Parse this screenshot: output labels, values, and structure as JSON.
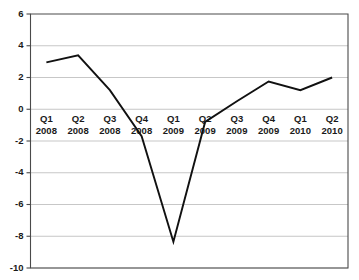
{
  "chart_data": {
    "type": "line",
    "title": "",
    "subtitle": "",
    "xlabel": "",
    "ylabel": "",
    "categories": [
      "Q1 2008",
      "Q2 2008",
      "Q3 2008",
      "Q4 2008",
      "Q1 2009",
      "Q2 2009",
      "Q3 2009",
      "Q4 2009",
      "Q1 2010",
      "Q2 2010"
    ],
    "category_parts": [
      {
        "quarter": "Q1",
        "year": "2008"
      },
      {
        "quarter": "Q2",
        "year": "2008"
      },
      {
        "quarter": "Q3",
        "year": "2008"
      },
      {
        "quarter": "Q4",
        "year": "2008"
      },
      {
        "quarter": "Q1",
        "year": "2009"
      },
      {
        "quarter": "Q2",
        "year": "2009"
      },
      {
        "quarter": "Q3",
        "year": "2009"
      },
      {
        "quarter": "Q4",
        "year": "2009"
      },
      {
        "quarter": "Q1",
        "year": "2010"
      },
      {
        "quarter": "Q2",
        "year": "2010"
      }
    ],
    "values": [
      2.95,
      3.4,
      1.2,
      -1.7,
      -8.35,
      -0.8,
      0.5,
      1.75,
      1.2,
      2.0
    ],
    "series": [
      {
        "name": "",
        "values": [
          2.95,
          3.4,
          1.2,
          -1.7,
          -8.35,
          -0.8,
          0.5,
          1.75,
          1.2,
          2.0
        ]
      }
    ],
    "ylim": [
      -10,
      6
    ],
    "yticks": [
      6,
      4,
      2,
      0,
      -2,
      -4,
      -6,
      -8,
      -10
    ],
    "ytick_labels": [
      "6",
      "4",
      "2",
      "0",
      "-2",
      "-4",
      "-6",
      "-8",
      "-10"
    ],
    "grid": true,
    "grid_axis": "y",
    "legend": false,
    "legend_position": "none",
    "line_color": "#111111",
    "grid_color": "#b9b9b9",
    "axis_color": "#4a4a4a",
    "background_color": "#ffffff"
  }
}
